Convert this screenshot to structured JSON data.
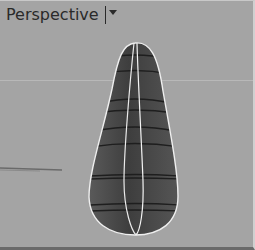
{
  "viewport": {
    "title": "Perspective",
    "dropdown_icon": "chevron-down-icon",
    "background": "#a4a4a4"
  },
  "model": {
    "shape": "teardrop surface",
    "surface_color": "#4a4a4a",
    "isocurve_color": "#1e1e1e",
    "highlight_color": "#f2f2f2"
  }
}
